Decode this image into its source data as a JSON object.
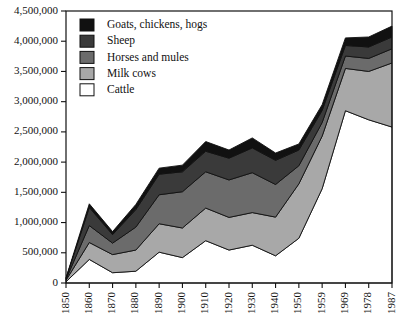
{
  "chart_data": {
    "type": "area",
    "stacked": true,
    "title": "",
    "subtitle": "",
    "xlabel": "",
    "ylabel": "",
    "grid": false,
    "legend_position": "top-left",
    "ylim": [
      0,
      4500000
    ],
    "ytick_labels": [
      "0",
      "500,000",
      "1,000,000",
      "1,500,000",
      "2,000,000",
      "2,500,000",
      "3,000,000",
      "3,500,000",
      "4,000,000",
      "4,500,000"
    ],
    "ytick_values": [
      0,
      500000,
      1000000,
      1500000,
      2000000,
      2500000,
      3000000,
      3500000,
      4000000,
      4500000
    ],
    "categories": [
      "1850",
      "1860",
      "1870",
      "1880",
      "1890",
      "1900",
      "1910",
      "1920",
      "1930",
      "1940",
      "1950",
      "1959",
      "1969",
      "1978",
      "1987"
    ],
    "x": [
      1850,
      1860,
      1870,
      1880,
      1890,
      1900,
      1910,
      1920,
      1930,
      1940,
      1950,
      1959,
      1969,
      1978,
      1987
    ],
    "series": [
      {
        "name": "Cattle",
        "color": "#ffffff",
        "order": 1,
        "values": [
          20000,
          390000,
          170000,
          195000,
          510000,
          420000,
          700000,
          545000,
          625000,
          450000,
          740000,
          1560000,
          2850000,
          2700000,
          2580000
        ]
      },
      {
        "name": "Milk cows",
        "color": "#a8a8a8",
        "order": 2,
        "values": [
          25000,
          280000,
          300000,
          350000,
          470000,
          490000,
          540000,
          540000,
          540000,
          640000,
          900000,
          870000,
          700000,
          800000,
          1060000
        ]
      },
      {
        "name": "Horses and mules",
        "color": "#6b6b6b",
        "order": 3,
        "values": [
          15000,
          280000,
          190000,
          380000,
          480000,
          600000,
          600000,
          620000,
          660000,
          540000,
          300000,
          225000,
          205000,
          215000,
          235000
        ]
      },
      {
        "name": "Sheep",
        "color": "#3a3a3a",
        "order": 4,
        "values": [
          15000,
          300000,
          140000,
          290000,
          340000,
          330000,
          340000,
          360000,
          410000,
          400000,
          260000,
          200000,
          175000,
          190000,
          195000
        ]
      },
      {
        "name": "Goats, chickens, hogs",
        "color": "#111111",
        "order": 5,
        "values": [
          10000,
          60000,
          50000,
          85000,
          100000,
          110000,
          160000,
          135000,
          165000,
          120000,
          100000,
          95000,
          125000,
          165000,
          180000
        ]
      }
    ],
    "totals": [
      85000,
      1310000,
      850000,
      1300000,
      1900000,
      1950000,
      2340000,
      2200000,
      2400000,
      2150000,
      2300000,
      2950000,
      4055000,
      4070000,
      4250000
    ]
  },
  "legend": {
    "items": [
      {
        "label": "Goats, chickens, hogs",
        "color": "#111111"
      },
      {
        "label": "Sheep",
        "color": "#3a3a3a"
      },
      {
        "label": "Horses and mules",
        "color": "#6b6b6b"
      },
      {
        "label": "Milk cows",
        "color": "#a8a8a8"
      },
      {
        "label": "Cattle",
        "color": "#ffffff"
      }
    ]
  }
}
